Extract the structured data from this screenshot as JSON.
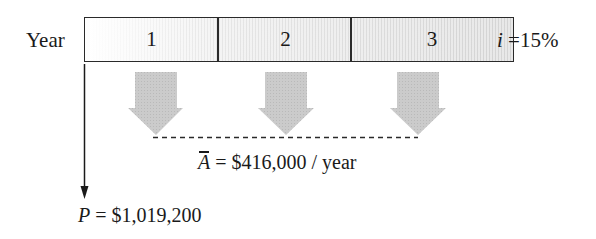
{
  "diagram": {
    "type": "cash-flow-diagram",
    "axis_label": "Year",
    "periods": [
      "1",
      "2",
      "3"
    ],
    "interest_rate": {
      "symbol": "i",
      "equals": " =",
      "value": "15%"
    },
    "annuity": {
      "symbol": "A",
      "overbar": true,
      "equals": " = ",
      "value": "$416,000",
      "unit": " / year",
      "count": 3,
      "direction": "down"
    },
    "present_worth": {
      "symbol": "P",
      "equals": " = ",
      "value": "$1,019,200",
      "at_period": 0,
      "direction": "down"
    },
    "colors": {
      "line": "#1a1a1a",
      "arrow_fill": "#c8c8c8",
      "box_border": "#2a2a2a"
    }
  }
}
